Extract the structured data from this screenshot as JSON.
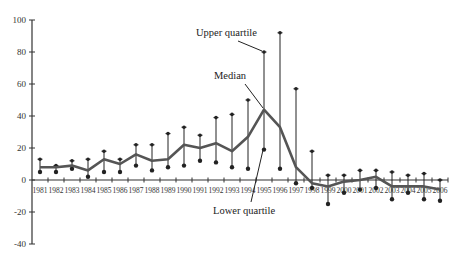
{
  "chart_data": {
    "type": "line",
    "title": "",
    "xlabel": "",
    "ylabel": "",
    "ylim": [
      -40,
      100
    ],
    "yticks": [
      100,
      80,
      60,
      40,
      20,
      0,
      -20,
      -40
    ],
    "grid": false,
    "legend": "none",
    "categories": [
      "1981",
      "1982",
      "1983",
      "1984",
      "1985",
      "1986",
      "1987",
      "1988",
      "1989",
      "1990",
      "1991",
      "1992",
      "1993",
      "1994",
      "1995",
      "1996",
      "1997",
      "1998",
      "1999",
      "2000",
      "2001",
      "2002",
      "2003",
      "2004",
      "2005",
      "2006"
    ],
    "series": [
      {
        "name": "Upper quartile",
        "values": [
          13,
          9,
          12,
          13,
          18,
          13,
          22,
          22,
          29,
          33,
          28,
          39,
          41,
          50,
          80,
          92,
          57,
          18,
          3,
          3,
          6,
          6,
          5,
          3,
          4,
          0
        ]
      },
      {
        "name": "Median",
        "values": [
          8,
          8,
          9,
          6,
          13,
          10,
          16,
          12,
          13,
          22,
          20,
          23,
          18,
          27,
          44,
          33,
          8,
          -2,
          -4,
          -1,
          0,
          2,
          -4,
          -4,
          -4,
          -6
        ]
      },
      {
        "name": "Lower quartile",
        "values": [
          5,
          5,
          7,
          2,
          5,
          5,
          9,
          6,
          8,
          9,
          12,
          11,
          8,
          7,
          19,
          7,
          -2,
          -5,
          -15,
          -8,
          -6,
          -5,
          -12,
          -8,
          -12,
          -13
        ]
      }
    ],
    "annotations": [
      {
        "text": "Upper quartile",
        "points_to": {
          "x": "1995",
          "series": "Upper quartile"
        }
      },
      {
        "text": "Median",
        "points_to": {
          "x": "1995",
          "series": "Median"
        }
      },
      {
        "text": "Lower quartile",
        "points_to": {
          "x": "1995",
          "series": "Lower quartile"
        }
      }
    ]
  },
  "colors": {
    "axis": "#333333",
    "median_line": "#555555",
    "whisker": "#222222"
  }
}
